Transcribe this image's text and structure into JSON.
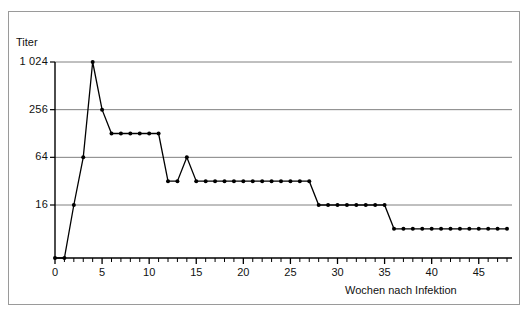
{
  "figure": {
    "y_axis_title": "Titer",
    "x_axis_title": "Wochen nach Infektion"
  },
  "chart_data": {
    "type": "line",
    "title": "",
    "xlabel": "Wochen nach Infektion",
    "ylabel": "Titer",
    "xlim": [
      0,
      48
    ],
    "ylim": [
      4,
      1024
    ],
    "yscale": "log2",
    "grid": true,
    "legend": null,
    "x_tick_labels": [
      "0",
      "5",
      "10",
      "15",
      "20",
      "25",
      "30",
      "35",
      "40",
      "45"
    ],
    "x_tick_values": [
      0,
      5,
      10,
      15,
      20,
      25,
      30,
      35,
      40,
      45
    ],
    "x_minor_tick_step": 1,
    "y_tick_labels": [
      "16",
      "64",
      "256",
      "1 024"
    ],
    "y_tick_values": [
      16,
      64,
      256,
      1024
    ],
    "markers": "filled-circle",
    "x": [
      0,
      1,
      2,
      3,
      4,
      5,
      6,
      7,
      8,
      9,
      10,
      11,
      12,
      13,
      14,
      15,
      16,
      17,
      18,
      19,
      20,
      21,
      22,
      23,
      24,
      25,
      26,
      27,
      28,
      29,
      30,
      31,
      32,
      33,
      34,
      35,
      36,
      37,
      38,
      39,
      40,
      41,
      42,
      43,
      44,
      45,
      46,
      47,
      48
    ],
    "values": [
      4,
      4,
      16,
      64,
      1024,
      256,
      128,
      128,
      128,
      128,
      128,
      128,
      32,
      32,
      64,
      32,
      32,
      32,
      32,
      32,
      32,
      32,
      32,
      32,
      32,
      32,
      32,
      32,
      16,
      16,
      16,
      16,
      16,
      16,
      16,
      16,
      8,
      8,
      8,
      8,
      8,
      8,
      8,
      8,
      8,
      8,
      8,
      8,
      8
    ],
    "series": [
      {
        "name": "Titer",
        "values": [
          4,
          4,
          16,
          64,
          1024,
          256,
          128,
          128,
          128,
          128,
          128,
          128,
          32,
          32,
          64,
          32,
          32,
          32,
          32,
          32,
          32,
          32,
          32,
          32,
          32,
          32,
          32,
          32,
          16,
          16,
          16,
          16,
          16,
          16,
          16,
          16,
          8,
          8,
          8,
          8,
          8,
          8,
          8,
          8,
          8,
          8,
          8,
          8,
          8
        ]
      }
    ],
    "colors": {
      "line": "#000000",
      "marker": "#000000",
      "grid": "#808080",
      "axis": "#000000",
      "frame": "#9a9a9a",
      "background": "#ffffff"
    }
  }
}
